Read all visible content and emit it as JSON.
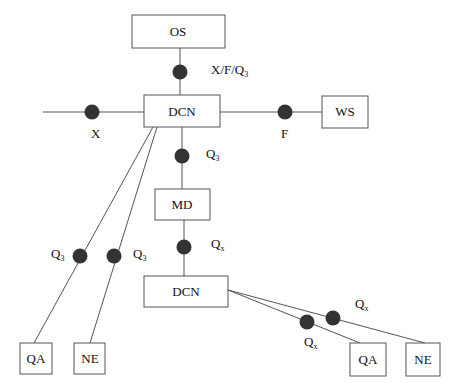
{
  "diagram": {
    "nodes": {
      "os": {
        "label": "OS"
      },
      "dcn_top": {
        "label": "DCN"
      },
      "ws": {
        "label": "WS"
      },
      "md": {
        "label": "MD"
      },
      "dcn_bottom": {
        "label": "DCN"
      },
      "qa_left": {
        "label": "QA"
      },
      "ne_left": {
        "label": "NE"
      },
      "qa_right": {
        "label": "QA"
      },
      "ne_right": {
        "label": "NE"
      }
    },
    "interfaces": {
      "os_dcn": {
        "label": "X/F/Q",
        "sub": "3"
      },
      "x_left": {
        "label": "X"
      },
      "f_ws": {
        "label": "F"
      },
      "dcn_md": {
        "label": "Q",
        "sub": "3"
      },
      "md_dcn": {
        "label": "Q",
        "sub": "x"
      },
      "dcn_qa_left": {
        "label": "Q",
        "sub": "3"
      },
      "dcn_ne_left": {
        "label": "Q",
        "sub": "3"
      },
      "dcn_qa_right": {
        "label": "Q",
        "sub": "x"
      },
      "dcn_ne_right": {
        "label": "Q",
        "sub": "x"
      }
    },
    "colors": {
      "line": "#555555",
      "dot": "#333333",
      "text": "#111111"
    }
  }
}
